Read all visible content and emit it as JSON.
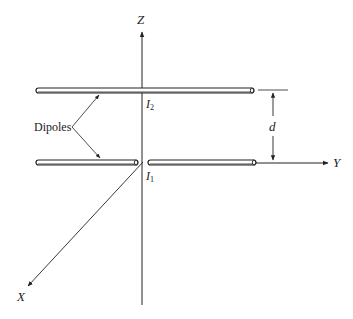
{
  "figure": {
    "axes": {
      "z_label": "Z",
      "y_label": "Y",
      "x_label": "X"
    },
    "currents": {
      "upper": {
        "symbol": "I",
        "subscript": "2"
      },
      "lower": {
        "symbol": "I",
        "subscript": "1"
      }
    },
    "annotations": {
      "dipoles_label": "Dipoles",
      "separation_label": "d"
    },
    "colors": {
      "line": "#222222",
      "background": "#ffffff"
    }
  }
}
